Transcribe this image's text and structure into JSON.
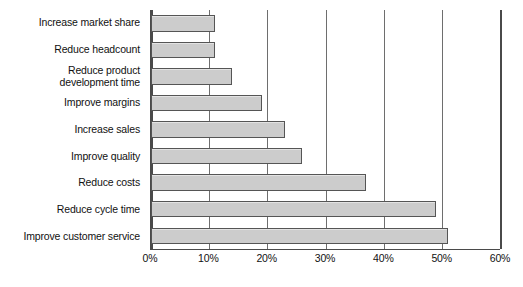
{
  "chart_data": {
    "type": "bar",
    "orientation": "horizontal",
    "title": "",
    "subtitle": "",
    "xlabel": "",
    "ylabel": "",
    "xlim": [
      0,
      60
    ],
    "xticks": [
      0,
      10,
      20,
      30,
      40,
      50,
      60
    ],
    "xtick_labels": [
      "0%",
      "10%",
      "20%",
      "30%",
      "40%",
      "50%",
      "60%"
    ],
    "grid": "vertical",
    "legend": "none",
    "bar_fill_color": "#cccccc",
    "bar_border_color": "#555555",
    "axis_color": "#4a4a4a",
    "gridline_color": "#6e6e6e",
    "background_color": "#ffffff",
    "categories": [
      "Increase market share",
      "Reduce headcount",
      "Reduce product\ndevelopment time",
      "Improve margins",
      "Increase sales",
      "Improve quality",
      "Reduce costs",
      "Reduce cycle time",
      "Improve customer service"
    ],
    "values": [
      11,
      11,
      14,
      19,
      23,
      26,
      37,
      49,
      51
    ],
    "value_labels": [
      "11%",
      "11%",
      "14%",
      "19%",
      "23%",
      "26%",
      "37%",
      "49%",
      "51%"
    ]
  }
}
